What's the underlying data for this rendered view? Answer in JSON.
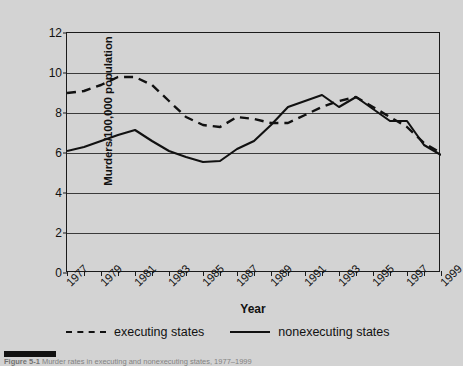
{
  "figure": {
    "caption_label": "Figure 5-1",
    "caption_text": "Murder rates in executing and nonexecuting states, 1977–1999"
  },
  "chart_data": {
    "type": "line",
    "title": "",
    "xlabel": "Year",
    "ylabel": "Murders/100,000 population",
    "xlim": [
      1977,
      1999
    ],
    "ylim": [
      0,
      12
    ],
    "ytick_step": 2,
    "grid": true,
    "legend_position": "bottom",
    "background_color": "#d3d3d3",
    "line_color": "#111111",
    "x": [
      1977,
      1978,
      1979,
      1980,
      1981,
      1982,
      1983,
      1984,
      1985,
      1986,
      1987,
      1988,
      1989,
      1990,
      1991,
      1992,
      1993,
      1994,
      1995,
      1996,
      1997,
      1998,
      1999
    ],
    "xtick_labels": [
      "1977",
      "1979",
      "1981",
      "1983",
      "1985",
      "1987",
      "1989",
      "1991",
      "1993",
      "1995",
      "1997",
      "1999"
    ],
    "ytick_labels": [
      "0",
      "2",
      "4",
      "6",
      "8",
      "10",
      "12"
    ],
    "series": [
      {
        "name": "executing states",
        "style": "dashed",
        "values": [
          9.0,
          9.1,
          9.4,
          9.8,
          9.8,
          9.4,
          8.6,
          7.8,
          7.4,
          7.3,
          7.8,
          7.7,
          7.5,
          7.5,
          7.9,
          8.3,
          8.6,
          8.8,
          8.3,
          7.8,
          7.3,
          6.5,
          6.0
        ]
      },
      {
        "name": "nonexecuting states",
        "style": "solid",
        "values": [
          6.1,
          6.3,
          6.6,
          6.9,
          7.15,
          6.6,
          6.1,
          5.8,
          5.55,
          5.6,
          6.2,
          6.6,
          7.4,
          8.3,
          8.6,
          8.9,
          8.3,
          8.8,
          8.2,
          7.6,
          7.6,
          6.4,
          5.9
        ]
      }
    ]
  },
  "axes": {
    "y_title": "Murders/100,000 population",
    "x_title": "Year"
  },
  "legend": {
    "items": [
      {
        "label": "executing states",
        "style": "dashed"
      },
      {
        "label": "nonexecuting states",
        "style": "solid"
      }
    ]
  }
}
